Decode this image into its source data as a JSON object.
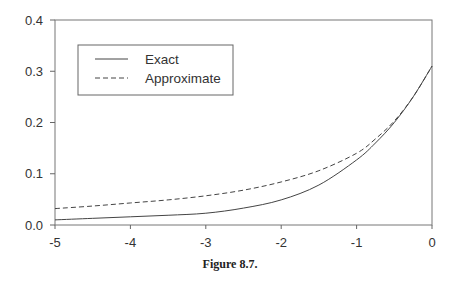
{
  "chart_data": {
    "type": "line",
    "title": "",
    "caption": "Figure 8.7.",
    "xlabel": "",
    "ylabel": "",
    "xlim": [
      -5,
      0
    ],
    "ylim": [
      0,
      0.4
    ],
    "x_ticks": [
      "-5",
      "-4",
      "-3",
      "-2",
      "-1",
      "0"
    ],
    "y_ticks": [
      "0.0",
      "0.1",
      "0.2",
      "0.3",
      "0.4"
    ],
    "grid": false,
    "legend_position": "upper-left",
    "series": [
      {
        "name": "Exact",
        "style": "solid",
        "x": [
          -5,
          -4.5,
          -4,
          -3.5,
          -3,
          -2.5,
          -2,
          -1.5,
          -1,
          -0.75,
          -0.5,
          -0.25,
          0
        ],
        "values": [
          0.01,
          0.013,
          0.016,
          0.019,
          0.023,
          0.033,
          0.049,
          0.078,
          0.127,
          0.16,
          0.2,
          0.25,
          0.31
        ]
      },
      {
        "name": "Approximate",
        "style": "dashed",
        "x": [
          -5,
          -4.5,
          -4,
          -3.5,
          -3,
          -2.5,
          -2,
          -1.5,
          -1,
          -0.75,
          -0.5,
          -0.25,
          0
        ],
        "values": [
          0.032,
          0.037,
          0.043,
          0.049,
          0.057,
          0.068,
          0.084,
          0.106,
          0.14,
          0.168,
          0.203,
          0.25,
          0.31
        ]
      }
    ]
  }
}
